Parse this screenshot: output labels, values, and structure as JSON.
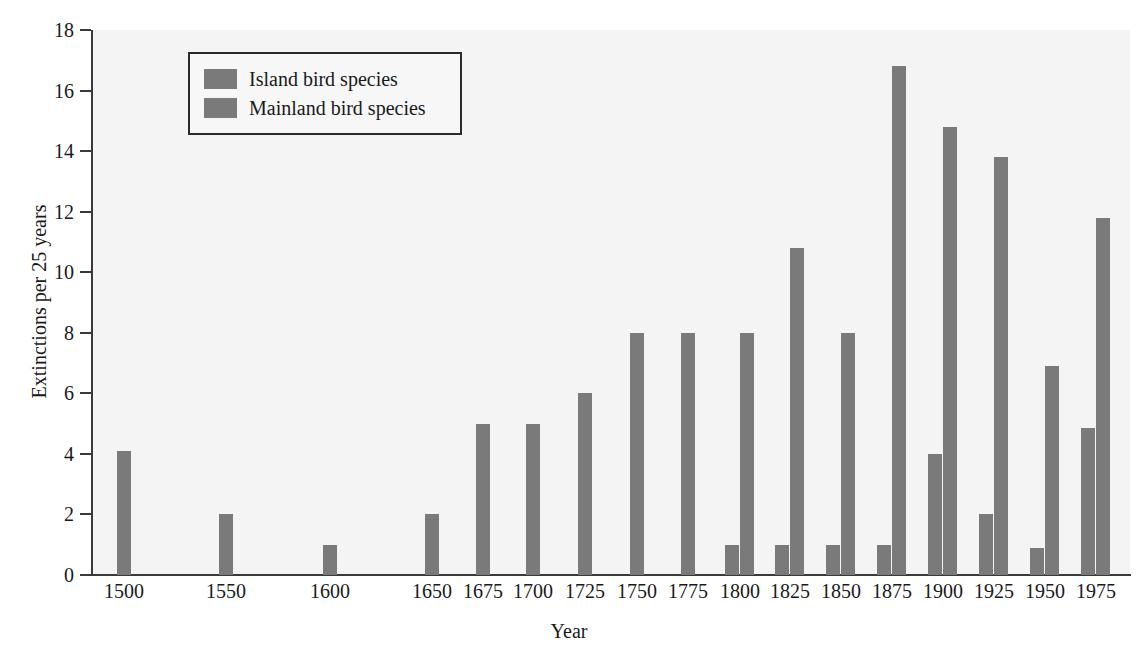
{
  "chart_data": {
    "type": "bar",
    "title": "",
    "subtitle": "",
    "xlabel": "Year",
    "ylabel": "Extinctions per 25 years",
    "categories": [
      "1500",
      "1550",
      "1600",
      "1650",
      "1675",
      "1700",
      "1725",
      "1750",
      "1775",
      "1800",
      "1825",
      "1850",
      "1875",
      "1900",
      "1925",
      "1950",
      "1975"
    ],
    "xtick_labels": [
      "1500",
      "1550",
      "1600",
      "1650",
      "1675",
      "1700",
      "1725",
      "1750",
      "1775",
      "1800",
      "1825",
      "1850",
      "1875",
      "1900",
      "1925",
      "1950",
      "1975"
    ],
    "ytick_labels": [
      "0",
      "2",
      "4",
      "6",
      "8",
      "10",
      "12",
      "14",
      "16",
      "18"
    ],
    "yticks": [
      0,
      2,
      4,
      6,
      8,
      10,
      12,
      14,
      16,
      18
    ],
    "ylim": [
      0,
      18
    ],
    "grid": false,
    "legend_position": "upper-left-inside",
    "bar_color": "#7a7a7a",
    "series": [
      {
        "name": "Island bird species",
        "color": "#7a7a7a",
        "values": [
          4.1,
          2.0,
          1.0,
          2.0,
          5.0,
          5.0,
          6.0,
          8.0,
          8.0,
          8.0,
          10.8,
          8.0,
          16.8,
          14.8,
          13.8,
          6.9,
          11.8
        ]
      },
      {
        "name": "Mainland bird species",
        "color": "#7a7a7a",
        "values": [
          0,
          0,
          0,
          0,
          0,
          0,
          0,
          0,
          0,
          1.0,
          1.0,
          1.0,
          1.0,
          4.0,
          2.0,
          0.9,
          4.85
        ]
      }
    ],
    "category_x_px": [
      124,
      226,
      330,
      432,
      483,
      533,
      585,
      637,
      688,
      740,
      790,
      841,
      892,
      943,
      994,
      1045,
      1096
    ]
  },
  "legend": {
    "items": [
      {
        "label": "Island bird species",
        "color": "#7a7a7a"
      },
      {
        "label": "Mainland bird species",
        "color": "#7a7a7a"
      }
    ]
  }
}
